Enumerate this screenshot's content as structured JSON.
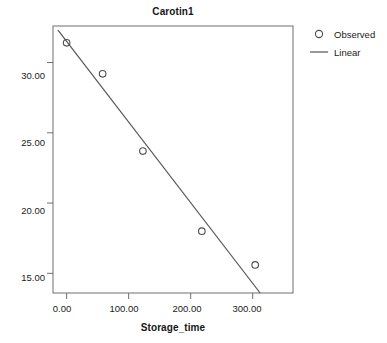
{
  "chart_data": {
    "type": "scatter",
    "title": "Carotin1",
    "xlabel": "Storage_time",
    "ylabel": "",
    "xlim": [
      -22,
      365
    ],
    "ylim": [
      13.6,
      32.6
    ],
    "grid": false,
    "legend_position": "right",
    "x_ticks": [
      {
        "value": 0,
        "label": "0.00"
      },
      {
        "value": 100,
        "label": "100.00"
      },
      {
        "value": 200,
        "label": "200.00"
      },
      {
        "value": 300,
        "label": "300.00"
      }
    ],
    "y_ticks": [
      {
        "value": 15,
        "label": "15.00"
      },
      {
        "value": 20,
        "label": "20.00"
      },
      {
        "value": 25,
        "label": "25.00"
      },
      {
        "value": 30,
        "label": "30.00"
      }
    ],
    "series": [
      {
        "name": "Observed",
        "type": "scatter",
        "marker": "open-circle",
        "color": "#4d4d4d",
        "points": [
          {
            "x": 0,
            "y": 31.4
          },
          {
            "x": 58,
            "y": 29.2
          },
          {
            "x": 123,
            "y": 23.7
          },
          {
            "x": 218,
            "y": 18.0
          },
          {
            "x": 304,
            "y": 15.6
          }
        ]
      },
      {
        "name": "Linear",
        "type": "line",
        "color": "#555555",
        "fit_endpoints": [
          {
            "x": -14,
            "y": 32.3
          },
          {
            "x": 312,
            "y": 13.6
          }
        ]
      }
    ],
    "legend": [
      {
        "label": "Observed",
        "key": "open-circle"
      },
      {
        "label": "Linear",
        "key": "line"
      }
    ]
  }
}
